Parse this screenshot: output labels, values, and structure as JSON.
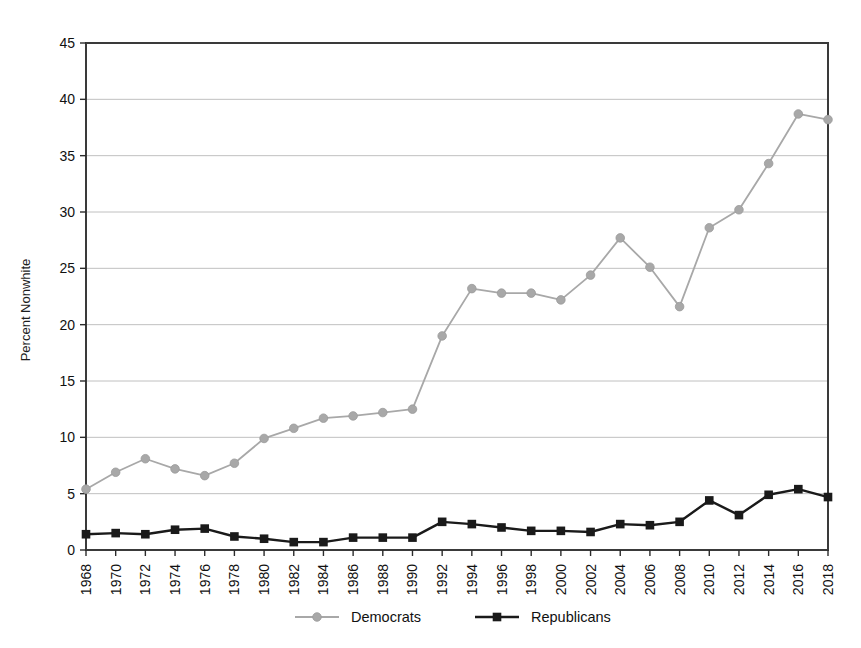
{
  "chart_data": {
    "type": "line",
    "title": "",
    "subtitle": "",
    "xlabel": "",
    "ylabel": "Percent Nonwhite",
    "xlim": [
      1968,
      2018
    ],
    "ylim": [
      0,
      45
    ],
    "ytick_step": 5,
    "xtick_step": 2,
    "grid": "horizontal",
    "legend_position": "bottom",
    "x": [
      1968,
      1970,
      1972,
      1974,
      1976,
      1978,
      1980,
      1982,
      1984,
      1986,
      1988,
      1990,
      1992,
      1994,
      1996,
      1998,
      2000,
      2002,
      2004,
      2006,
      2008,
      2010,
      2012,
      2014,
      2016,
      2018
    ],
    "xtick_labels": [
      "1968",
      "1970",
      "1972",
      "1974",
      "1976",
      "1978",
      "1980",
      "1982",
      "1984",
      "1986",
      "1988",
      "1990",
      "1992",
      "1994",
      "1996",
      "1998",
      "2000",
      "2002",
      "2004",
      "2006",
      "2008",
      "2010",
      "2012",
      "2014",
      "2016",
      "2018"
    ],
    "ytick_labels": [
      "0",
      "5",
      "10",
      "15",
      "20",
      "25",
      "30",
      "35",
      "40",
      "45"
    ],
    "ytick_values": [
      0,
      5,
      10,
      15,
      20,
      25,
      30,
      35,
      40,
      45
    ],
    "series": [
      {
        "name": "Democrats",
        "color": "#a8a8a8",
        "marker": "circle",
        "values": [
          5.4,
          6.9,
          8.1,
          7.2,
          6.6,
          7.7,
          9.9,
          10.8,
          11.7,
          11.9,
          12.2,
          12.5,
          19.0,
          23.2,
          22.8,
          22.8,
          22.2,
          24.4,
          27.7,
          25.1,
          21.6,
          28.6,
          30.2,
          34.3,
          38.7,
          38.2
        ]
      },
      {
        "name": "Republicans",
        "color": "#1a1a1a",
        "marker": "square",
        "values": [
          1.4,
          1.5,
          1.4,
          1.8,
          1.9,
          1.2,
          1.0,
          0.7,
          0.7,
          1.1,
          1.1,
          1.1,
          2.5,
          2.3,
          2.0,
          1.7,
          1.7,
          1.6,
          2.3,
          2.2,
          2.5,
          4.4,
          3.1,
          4.9,
          5.4,
          4.7
        ]
      }
    ],
    "legend": [
      {
        "label": "Democrats",
        "color": "#a8a8a8",
        "marker": "circle"
      },
      {
        "label": "Republicans",
        "color": "#1a1a1a",
        "marker": "square"
      }
    ]
  }
}
